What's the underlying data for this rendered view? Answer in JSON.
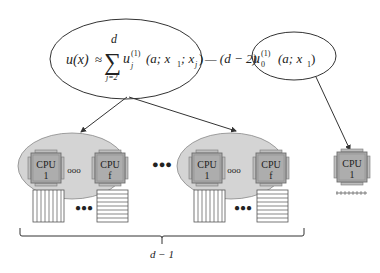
{
  "diagram": {
    "type": "parallel-decomposition",
    "formula": {
      "lhs": "u(x)",
      "approx": "≈",
      "sum_symbol": "∑",
      "sum_upper": "d",
      "sum_lower": "j=2",
      "term_base": "u",
      "term_sub": "j",
      "term_sup": "(1)",
      "term_args": "(a; x",
      "term_args_sub1": "1",
      "term_args_mid": "; x",
      "term_args_sub2": "j",
      "term_args_close": ")",
      "minus_coeff": "— (d − 2)",
      "second_base": "u",
      "second_sub": "0",
      "second_sup": "(1)",
      "second_args": "(a; x",
      "second_args_sub": "1",
      "second_args_close": ")"
    },
    "clusters": [
      {
        "name": "cluster-1",
        "cpus": [
          {
            "label_top": "CPU",
            "label_bottom": "1"
          },
          {
            "label_top": "CPU",
            "label_bottom": "f"
          }
        ],
        "cpu_ellipsis": "ooo",
        "storage_ellipsis": "●●●"
      },
      {
        "name": "cluster-2",
        "cpus": [
          {
            "label_top": "CPU",
            "label_bottom": "1"
          },
          {
            "label_top": "CPU",
            "label_bottom": "f"
          }
        ],
        "cpu_ellipsis": "ooo",
        "storage_ellipsis": "●●●"
      }
    ],
    "between_clusters_ellipsis": "●●●",
    "single_node": {
      "label_top": "CPU",
      "label_bottom": "1"
    },
    "brace_label": "d − 1",
    "colors": {
      "cluster_fill": "#d4d4d4",
      "cpu_fill": "#a9a9a9",
      "cpu_border": "#6e6e6e",
      "line": "#333333",
      "ellipse_fill": "#ffffff"
    }
  }
}
